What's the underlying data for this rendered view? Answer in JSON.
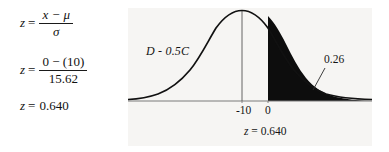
{
  "formula": {
    "line1": {
      "lhs": "z",
      "eq": "=",
      "numerator": "x − μ",
      "denominator": "σ"
    },
    "line2": {
      "lhs": "z",
      "eq": "=",
      "numerator": "0 − (10)",
      "denominator": "15.62"
    },
    "line3": {
      "lhs": "z",
      "eq": "=",
      "value": "0.640"
    }
  },
  "chart_data": {
    "type": "area",
    "title": "",
    "subtitle": "",
    "xlabel": "",
    "ylabel": "",
    "curve_label": "D - 0.5C",
    "tail_probability": "0.26",
    "tail_probability_value": 0.26,
    "z_label": "z = 0.640",
    "z_value": 0.64,
    "tick_labels": [
      "-10",
      "0"
    ],
    "tick_values": [
      -10,
      0
    ],
    "mean": -10,
    "std_dev": 15.62,
    "cutoff": 0,
    "shaded_region": "right-tail",
    "shaded_color": "#0d0d0d",
    "curve_color": "#111111",
    "panel_background": "#f6f5f3",
    "axis_color": "#6b6b6b",
    "grid": false,
    "legend": "none",
    "xlim": [
      -60,
      45
    ],
    "ylim": [
      0,
      1
    ]
  }
}
